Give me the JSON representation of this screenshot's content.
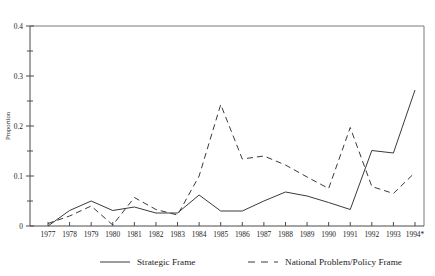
{
  "chart_data": {
    "type": "line",
    "title": "",
    "xlabel": "",
    "ylabel": "Proportion",
    "ylim": [
      0,
      0.4
    ],
    "yticks": [
      0,
      0.1,
      0.2,
      0.3,
      0.4
    ],
    "ytick_labels": [
      "0",
      "0.1",
      "0.2",
      "0.3",
      "0.4"
    ],
    "yminor_ticks": [
      0.05,
      0.15,
      0.25,
      0.35
    ],
    "grid": false,
    "legend_position": "bottom",
    "categories": [
      "1977",
      "1978",
      "1979",
      "1980",
      "1981",
      "1982",
      "1983",
      "1984",
      "1985",
      "1986",
      "1987",
      "1988",
      "1989",
      "1990",
      "1991",
      "1992",
      "1993",
      "1994*"
    ],
    "series": [
      {
        "name": "Strategic Frame",
        "style": "solid",
        "values": [
          0.0,
          0.031,
          0.05,
          0.031,
          0.038,
          0.026,
          0.026,
          0.062,
          0.03,
          0.03,
          0.05,
          0.068,
          0.06,
          0.047,
          0.033,
          0.151,
          0.146,
          0.272
        ]
      },
      {
        "name": "National Problem/Policy Frame",
        "style": "dashed",
        "values": [
          0.005,
          0.02,
          0.04,
          0.002,
          0.057,
          0.033,
          0.022,
          0.1,
          0.243,
          0.134,
          0.14,
          0.122,
          0.098,
          0.075,
          0.197,
          0.079,
          0.065,
          0.107
        ]
      }
    ]
  },
  "legend": {
    "entries": [
      {
        "label": "Strategic Frame",
        "style": "solid"
      },
      {
        "label": "National Problem/Policy Frame",
        "style": "dashed"
      }
    ]
  },
  "axes": {
    "y_axis_title": "Proportion"
  }
}
